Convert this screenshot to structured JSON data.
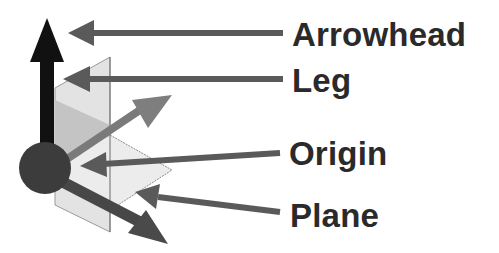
{
  "diagram": {
    "labels": {
      "arrowhead": "Arrowhead",
      "leg": "Leg",
      "origin": "Origin",
      "plane": "Plane"
    },
    "colors": {
      "vertical_axis": "#111111",
      "origin_sphere": "#3c3c3c",
      "diagonal_axis": "#7a7a7a",
      "lower_axis": "#474747",
      "plane_light": "#e6e6e6",
      "plane_mid": "#c8c8c8",
      "callout_arrow": "#5a5a5a",
      "text": "#2a2a2a"
    }
  }
}
